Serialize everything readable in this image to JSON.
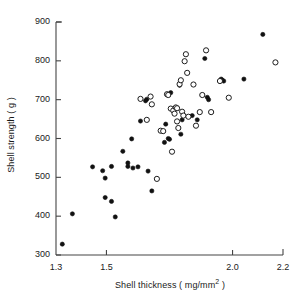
{
  "chart_data": {
    "type": "scatter",
    "title": "",
    "subtitle": "",
    "xlabel": "Shell thickness ( mg/mm2 )",
    "xlabel_base": "Shell thickness ( mg/mm",
    "xlabel_exponent": "2",
    "xlabel_tail": " )",
    "ylabel": "Shell strength ( g )",
    "xlim": [
      1.3,
      2.2
    ],
    "ylim": [
      300,
      900
    ],
    "xticks": [
      1.3,
      1.5,
      2.0,
      2.2
    ],
    "xtick_labels": [
      "1.3",
      "1.5",
      "2.0",
      "2.2"
    ],
    "yticks": [
      300,
      400,
      500,
      600,
      700,
      800,
      900
    ],
    "ytick_labels": [
      "300",
      "400",
      "500",
      "600",
      "700",
      "800",
      "900"
    ],
    "grid": false,
    "legend_position": "none",
    "marker_color": "#111111",
    "axis_color": "#444444",
    "series": [
      {
        "name": "filled",
        "marker": "filled-circle",
        "marker_size_px": 4.2,
        "points": [
          [
            1.325,
            328
          ],
          [
            1.365,
            406
          ],
          [
            1.445,
            527
          ],
          [
            1.485,
            517
          ],
          [
            1.495,
            498
          ],
          [
            1.495,
            448
          ],
          [
            1.52,
            528
          ],
          [
            1.52,
            438
          ],
          [
            1.535,
            398
          ],
          [
            1.565,
            567
          ],
          [
            1.585,
            537
          ],
          [
            1.585,
            528
          ],
          [
            1.6,
            599
          ],
          [
            1.605,
            524
          ],
          [
            1.625,
            527
          ],
          [
            1.635,
            645
          ],
          [
            1.655,
            697
          ],
          [
            1.66,
            701
          ],
          [
            1.665,
            516
          ],
          [
            1.68,
            465
          ],
          [
            1.73,
            590
          ],
          [
            1.735,
            637
          ],
          [
            1.745,
            600
          ],
          [
            1.75,
            598
          ],
          [
            1.755,
            718
          ],
          [
            1.79,
            737
          ],
          [
            1.795,
            611
          ],
          [
            1.8,
            648
          ],
          [
            1.84,
            659
          ],
          [
            1.86,
            648
          ],
          [
            1.89,
            806
          ],
          [
            1.9,
            706
          ],
          [
            1.905,
            700
          ],
          [
            1.955,
            753
          ],
          [
            1.96,
            750
          ],
          [
            1.965,
            748
          ],
          [
            2.045,
            753
          ],
          [
            2.12,
            868
          ]
        ]
      },
      {
        "name": "open",
        "marker": "open-circle",
        "marker_size_px": 4.6,
        "points": [
          [
            1.635,
            702
          ],
          [
            1.66,
            648
          ],
          [
            1.675,
            708
          ],
          [
            1.68,
            688
          ],
          [
            1.7,
            496
          ],
          [
            1.715,
            620
          ],
          [
            1.725,
            619
          ],
          [
            1.74,
            714
          ],
          [
            1.745,
            712
          ],
          [
            1.755,
            677
          ],
          [
            1.76,
            566
          ],
          [
            1.765,
            672
          ],
          [
            1.77,
            664
          ],
          [
            1.775,
            680
          ],
          [
            1.78,
            678
          ],
          [
            1.78,
            644
          ],
          [
            1.785,
            627
          ],
          [
            1.79,
            740
          ],
          [
            1.795,
            750
          ],
          [
            1.8,
            669
          ],
          [
            1.805,
            659
          ],
          [
            1.81,
            799
          ],
          [
            1.815,
            817
          ],
          [
            1.82,
            769
          ],
          [
            1.825,
            656
          ],
          [
            1.845,
            739
          ],
          [
            1.855,
            633
          ],
          [
            1.87,
            668
          ],
          [
            1.88,
            712
          ],
          [
            1.895,
            827
          ],
          [
            1.915,
            668
          ],
          [
            1.95,
            748
          ],
          [
            1.985,
            705
          ],
          [
            2.17,
            796
          ]
        ]
      }
    ]
  }
}
